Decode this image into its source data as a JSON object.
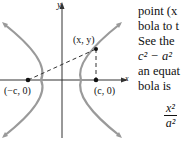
{
  "figure": {
    "axis_labels": {
      "x": "x",
      "y": "y"
    },
    "point_labels": {
      "point": "(x, y)",
      "left_focus": "(−c, 0)",
      "right_focus": "(c, 0)"
    },
    "colors": {
      "curve": "#9a9a9a",
      "axis": "#333333",
      "dashed": "#333333"
    }
  },
  "text": {
    "lines": [
      "point (x",
      "bola to t",
      "See the",
      "c² − a²",
      "an equat",
      "bola is"
    ],
    "fraction": {
      "numerator": "x²",
      "denominator": "a²"
    }
  }
}
